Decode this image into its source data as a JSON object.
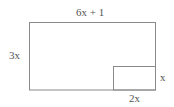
{
  "diagram": {
    "type": "rectangle-with-cutout",
    "labels": {
      "top": "6x + 1",
      "left": "3x",
      "inner_right": "x",
      "inner_bottom": "2x"
    },
    "outer_rect": {
      "width_label": "6x + 1",
      "height_label": "3x"
    },
    "inner_rect": {
      "width_label": "2x",
      "height_label": "x",
      "position": "bottom-right corner"
    },
    "colors": {
      "stroke": "#888888",
      "text": "#555555",
      "background": "#ffffff"
    }
  }
}
